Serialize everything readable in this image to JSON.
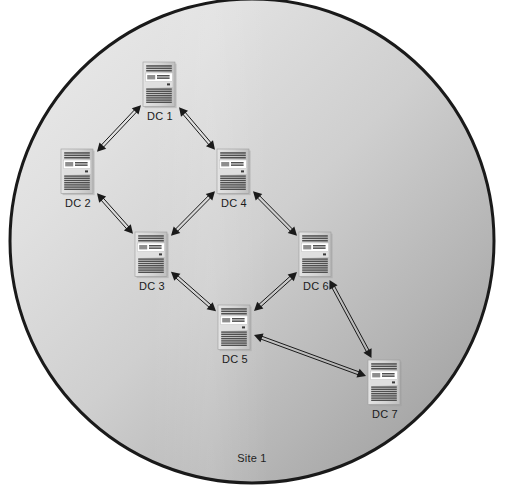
{
  "diagram": {
    "type": "network-topology",
    "title": "Site 1",
    "site_label": "Site 1",
    "boundary": {
      "shape": "circle",
      "center_x": 252,
      "center_y": 241,
      "radius": 242,
      "border_color": "#1a1a1a",
      "border_width": 3,
      "fill_gradient_start": "#e8e8e8",
      "fill_gradient_end": "#9a9a9a"
    },
    "nodes": [
      {
        "id": "dc1",
        "label": "DC 1",
        "x": 160,
        "y": 85,
        "icon": "server-tower-icon"
      },
      {
        "id": "dc2",
        "label": "DC 2",
        "x": 78,
        "y": 172,
        "icon": "server-tower-icon"
      },
      {
        "id": "dc3",
        "label": "DC 3",
        "x": 152,
        "y": 255,
        "icon": "server-tower-icon"
      },
      {
        "id": "dc4",
        "label": "DC 4",
        "x": 234,
        "y": 172,
        "icon": "server-tower-icon"
      },
      {
        "id": "dc5",
        "label": "DC 5",
        "x": 235,
        "y": 328,
        "icon": "server-tower-icon"
      },
      {
        "id": "dc6",
        "label": "DC 6",
        "x": 316,
        "y": 255,
        "icon": "server-tower-icon"
      },
      {
        "id": "dc7",
        "label": "DC 7",
        "x": 385,
        "y": 383,
        "icon": "server-tower-icon"
      }
    ],
    "links": [
      {
        "from": "dc1",
        "to": "dc2",
        "direction": "bidirectional"
      },
      {
        "from": "dc1",
        "to": "dc4",
        "direction": "bidirectional"
      },
      {
        "from": "dc2",
        "to": "dc3",
        "direction": "bidirectional"
      },
      {
        "from": "dc3",
        "to": "dc4",
        "direction": "bidirectional"
      },
      {
        "from": "dc3",
        "to": "dc5",
        "direction": "bidirectional"
      },
      {
        "from": "dc4",
        "to": "dc6",
        "direction": "bidirectional"
      },
      {
        "from": "dc5",
        "to": "dc6",
        "direction": "bidirectional"
      },
      {
        "from": "dc5",
        "to": "dc7",
        "direction": "bidirectional"
      },
      {
        "from": "dc6",
        "to": "dc7",
        "direction": "bidirectional"
      }
    ],
    "link_style": {
      "stroke_color": "#1a1a1a",
      "stroke_width": 1,
      "shaft": "double-line",
      "arrowhead": "solid-triangle"
    },
    "icon_style": {
      "body_fill": "#d6d6d6",
      "body_edge": "#8f8f8f",
      "stripe_color": "#4a4a4a",
      "panel_fill": "#ffffff",
      "width": 34,
      "height": 46
    }
  }
}
